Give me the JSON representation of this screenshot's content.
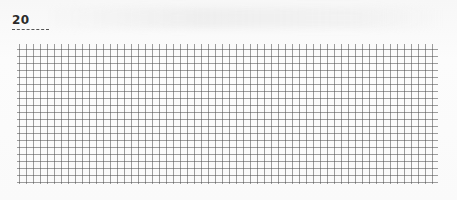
{
  "page": {
    "number": "20",
    "paper": "graph-paper",
    "grid": {
      "cell_size_px": 7,
      "line_color": "#7a7a7a",
      "background": "#fbfbfb"
    }
  }
}
